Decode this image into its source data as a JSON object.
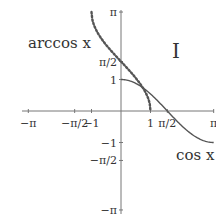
{
  "chart_data": {
    "type": "line",
    "title": "",
    "panel_label": "I",
    "xlabel": "",
    "ylabel": "",
    "xlim": [
      -3.1416,
      3.1416
    ],
    "ylim": [
      -3.1416,
      3.1416
    ],
    "grid": false,
    "x_ticks": [
      {
        "value": -3.1416,
        "label": "−π"
      },
      {
        "value": -1.5708,
        "label": "−π/2"
      },
      {
        "value": -1,
        "label": "−1"
      },
      {
        "value": 1,
        "label": "1"
      },
      {
        "value": 1.5708,
        "label": "π/2"
      },
      {
        "value": 3.1416,
        "label": "π"
      }
    ],
    "y_ticks": [
      {
        "value": 3.1416,
        "label": "π"
      },
      {
        "value": 1.5708,
        "label": "π/2"
      },
      {
        "value": 1,
        "label": "1"
      },
      {
        "value": -1,
        "label": "−1"
      },
      {
        "value": -1.5708,
        "label": "−π/2"
      },
      {
        "value": -3.1416,
        "label": "−π"
      }
    ],
    "series": [
      {
        "name": "cos x",
        "style": "solid",
        "color": "#555555",
        "function": "cos",
        "domain": [
          0,
          3.1416
        ],
        "points": [
          [
            0,
            1
          ],
          [
            0.5,
            0.878
          ],
          [
            1,
            0.54
          ],
          [
            1.5708,
            0
          ],
          [
            2,
            -0.416
          ],
          [
            2.5,
            -0.801
          ],
          [
            3.1416,
            -1
          ]
        ]
      },
      {
        "name": "arccos x",
        "style": "dotted",
        "color": "#555555",
        "function": "arccos",
        "domain": [
          -1,
          1
        ],
        "points": [
          [
            -1,
            3.1416
          ],
          [
            -0.5,
            2.094
          ],
          [
            0,
            1.5708
          ],
          [
            0.5,
            1.047
          ],
          [
            1,
            0
          ]
        ]
      }
    ],
    "annotations": [
      {
        "text": "arccos x",
        "near": "top-left"
      },
      {
        "text": "cos x",
        "near": "bottom-right"
      }
    ]
  }
}
